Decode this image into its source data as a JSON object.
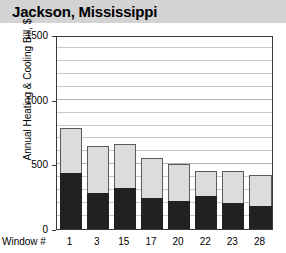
{
  "header": {
    "title": "Jackson, Mississippi"
  },
  "axes": {
    "ylabel": "Annual Heating & Cooling Bill, $",
    "xlabel_caption": "Window #",
    "yticks": [
      "0",
      "500",
      "1000",
      "1500"
    ]
  },
  "colors": {
    "title_band": "#d3d3d3",
    "heating_segment": "#212121",
    "cooling_segment": "#dcdcdc",
    "gridline": "#c8c8c8",
    "frame": "#3a3a3a",
    "background": "#ffffff"
  },
  "chart_data": {
    "type": "bar",
    "subtype": "stacked",
    "title": "Jackson, Mississippi",
    "xlabel": "Window #",
    "ylabel": "Annual Heating & Cooling Bill, $",
    "ylim": [
      0,
      1500
    ],
    "ytick_values": [
      0,
      500,
      1000,
      1500
    ],
    "grid": true,
    "grid_interval": 100,
    "legend": null,
    "categories": [
      "1",
      "3",
      "15",
      "17",
      "20",
      "22",
      "23",
      "28"
    ],
    "series": [
      {
        "name": "lower-segment",
        "color": "#212121",
        "values": [
          430,
          280,
          320,
          240,
          215,
          255,
          200,
          175
        ]
      },
      {
        "name": "upper-segment",
        "color": "#dcdcdc",
        "values": [
          350,
          360,
          335,
          310,
          285,
          195,
          245,
          245
        ]
      }
    ],
    "totals": [
      780,
      640,
      655,
      550,
      500,
      450,
      445,
      420
    ]
  }
}
